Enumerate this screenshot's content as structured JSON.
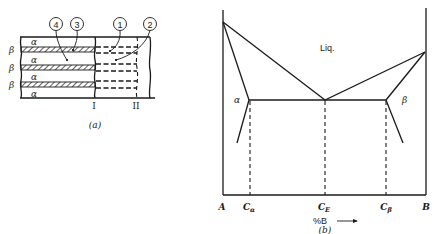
{
  "panel_a": {
    "caption": "(a)",
    "phase_layers": [
      "α",
      "β",
      "α",
      "β",
      "α",
      "β",
      "α"
    ],
    "phase_labels": {
      "alpha": "α",
      "beta": "β"
    },
    "callouts": [
      "4",
      "3",
      "1",
      "2"
    ],
    "line_labels": [
      "I",
      "II"
    ]
  },
  "panel_b": {
    "caption": "(b)",
    "region_labels": {
      "liquid": "Liq.",
      "alpha": "α",
      "beta": "β"
    },
    "x_labels": {
      "A": "A",
      "C_alpha": "C",
      "C_alpha_sub": "α",
      "C_E": "C",
      "C_E_sub": "E",
      "C_beta": "C",
      "C_beta_sub": "β",
      "B": "B"
    },
    "axis_label": "%B",
    "axis_arrow": "→"
  }
}
